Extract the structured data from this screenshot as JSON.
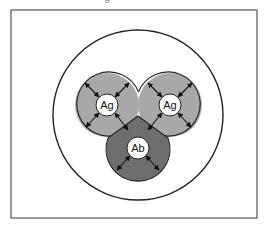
{
  "caption_fragment": "g",
  "diagram": {
    "frame": {
      "x": 11,
      "y": 10,
      "width": 246,
      "height": 208,
      "stroke": "#555555"
    },
    "outer_circle": {
      "cx": 138,
      "cy": 115,
      "r": 85,
      "stroke": "#222222"
    },
    "colors": {
      "antigen_fill": "#a8a8a8",
      "antibody_fill": "#6e6e6e",
      "core_fill": "#ffffff",
      "outline": "#222222",
      "arrow": "#111111"
    },
    "nodes": [
      {
        "id": "antigen-left",
        "label": "Ag",
        "type": "antigen",
        "cx": 107,
        "cy": 105,
        "r": 32,
        "core_r": 11
      },
      {
        "id": "antigen-right",
        "label": "Ag",
        "type": "antigen",
        "cx": 170,
        "cy": 105,
        "r": 32,
        "core_r": 11
      },
      {
        "id": "antibody",
        "label": "Ab",
        "type": "antibody",
        "cx": 138,
        "cy": 148,
        "r": 32,
        "core_r": 11
      }
    ]
  }
}
